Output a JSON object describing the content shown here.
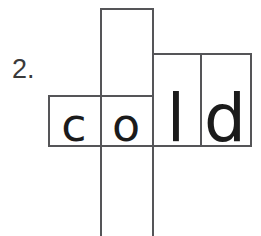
{
  "worksheet": {
    "item_number": "2.",
    "word": "cold",
    "letters": [
      {
        "char": "c",
        "shape": "short"
      },
      {
        "char": "o",
        "shape": "short"
      },
      {
        "char": "l",
        "shape": "tall"
      },
      {
        "char": "d",
        "shape": "tall"
      }
    ],
    "colors": {
      "background": "#ffffff",
      "box_stroke": "#555558",
      "letter": "#1b1b1b",
      "number": "#3a3a3a"
    },
    "box_outline_boxes": [
      {
        "name": "ascender-box-above-o",
        "x": 100,
        "y": 8,
        "width": 52,
        "height": 87
      },
      {
        "name": "letter-box-c",
        "x": 48,
        "y": 95,
        "width": 52,
        "height": 50
      },
      {
        "name": "letter-box-o",
        "x": 100,
        "y": 95,
        "width": 52,
        "height": 50
      },
      {
        "name": "letter-box-l",
        "x": 152,
        "y": 53,
        "width": 48,
        "height": 92
      },
      {
        "name": "letter-box-d",
        "x": 200,
        "y": 53,
        "width": 52,
        "height": 92
      }
    ],
    "descender_lines": [
      {
        "name": "descender-line-left",
        "x": 100,
        "y_top": 145,
        "y_bottom": 236
      },
      {
        "name": "descender-line-right",
        "x": 152,
        "y_top": 145,
        "y_bottom": 236
      }
    ]
  }
}
